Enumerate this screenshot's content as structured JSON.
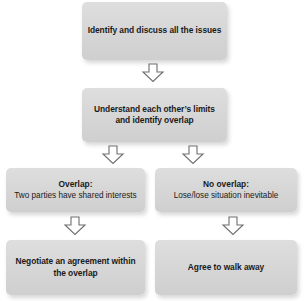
{
  "diagram": {
    "type": "flowchart",
    "orientation": "top-to-bottom",
    "nodes": [
      {
        "id": "identify",
        "text": "Identify and discuss all the issues",
        "style": "bold"
      },
      {
        "id": "understand",
        "text": "Understand each other’s limits and identify overlap",
        "style": "bold"
      },
      {
        "id": "overlap",
        "head": "Overlap:",
        "sub": "Two parties have shared interests"
      },
      {
        "id": "no_overlap",
        "head": "No overlap:",
        "sub": "Lose/lose situation inevitable"
      },
      {
        "id": "negotiate",
        "text": "Negotiate an agreement within the overlap",
        "style": "bold"
      },
      {
        "id": "walk_away",
        "text": "Agree to walk away",
        "style": "bold"
      }
    ],
    "connectors": [
      {
        "id": "c1",
        "from": "identify",
        "to": "understand",
        "glyph": "down-arrow"
      },
      {
        "id": "c2l",
        "from": "understand",
        "to": "overlap",
        "glyph": "down-arrow"
      },
      {
        "id": "c2r",
        "from": "understand",
        "to": "no_overlap",
        "glyph": "down-arrow"
      },
      {
        "id": "c3l",
        "from": "overlap",
        "to": "negotiate",
        "glyph": "down-arrow"
      },
      {
        "id": "c3r",
        "from": "no_overlap",
        "to": "walk_away",
        "glyph": "down-arrow"
      }
    ],
    "colors": {
      "node_fill": "#d7d7d7",
      "node_text": "#1a1a1a",
      "arrow_stroke": "#6e6e6e",
      "arrow_fill": "#ffffff",
      "background": "#ffffff"
    }
  }
}
